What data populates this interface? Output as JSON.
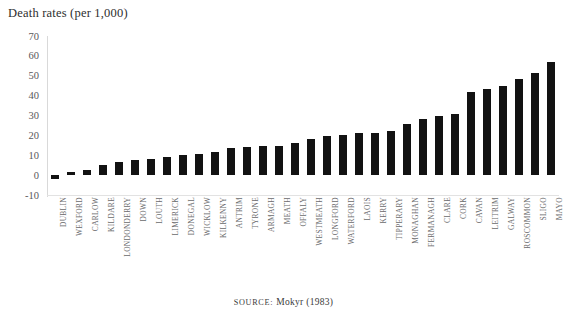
{
  "title": "Death rates (per 1,000)",
  "source": {
    "label": "SOURCE:",
    "text": "Mokyr (1983)"
  },
  "axis": {
    "y_ticks": [
      "70",
      "60",
      "50",
      "40",
      "30",
      "20",
      "10",
      "0",
      "-10"
    ]
  },
  "chart_data": {
    "type": "bar",
    "title": "Death rates (per 1,000)",
    "xlabel": "",
    "ylabel": "Death rates (per 1,000)",
    "ylim": [
      -10,
      70
    ],
    "ytick_step": 10,
    "grid": false,
    "legend": null,
    "bar_color": "#121212",
    "categories": [
      "DUBLIN",
      "WEXFORD",
      "CARLOW",
      "KILDARE",
      "LONDONDERRY",
      "DOWN",
      "LOUTH",
      "LIMERICK",
      "DONEGAL",
      "WICKLOW",
      "KILKENNY",
      "ANTRIM",
      "TYRONE",
      "ARMAGH",
      "MEATH",
      "OFFALY",
      "WESTMEATH",
      "LONGFORD",
      "WATERFORD",
      "LAOIS",
      "KERRY",
      "TIPPERARY",
      "MONAGHAN",
      "FERMANAGH",
      "CLARE",
      "CORK",
      "CAVAN",
      "LEITRIM",
      "GALWAY",
      "ROSCOMMON",
      "SLIGO",
      "MAYO"
    ],
    "values": [
      -2,
      1.5,
      2.5,
      5,
      6.5,
      7.5,
      8,
      9,
      10,
      10.5,
      11.5,
      13.5,
      14,
      14.5,
      14.5,
      16,
      18,
      19.5,
      20,
      21,
      21,
      22,
      25.5,
      28,
      29.5,
      31,
      42,
      43.5,
      45,
      48.5,
      51.5,
      57
    ]
  }
}
